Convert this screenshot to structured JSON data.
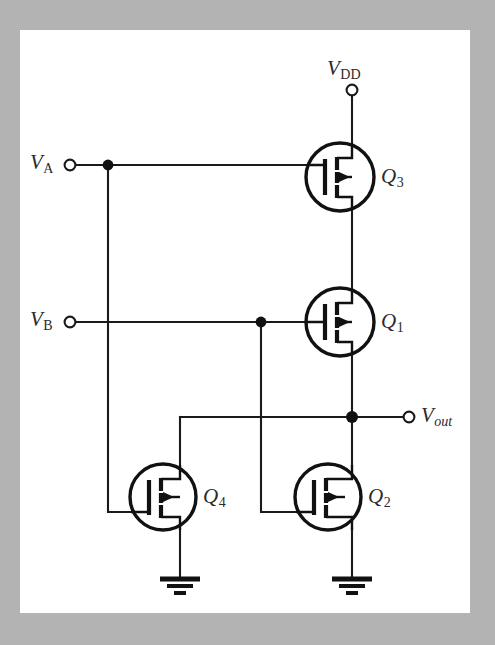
{
  "figure": {
    "kind": "circuit-schematic",
    "background_color": "#b3b3b3",
    "panel_color": "#ffffff",
    "ink_color": "#111111"
  },
  "terminals": [
    {
      "id": "vdd",
      "name": "supply-terminal",
      "symbol": "V",
      "subscript": "DD",
      "subscript_italic": false,
      "label_x": 327,
      "label_y": 58,
      "node_x": 352,
      "node_y": 93
    },
    {
      "id": "va",
      "name": "input-a-terminal",
      "symbol": "V",
      "subscript": "A",
      "subscript_italic": false,
      "label_x": 33,
      "label_y": 152,
      "node_x": 70,
      "node_y": 165
    },
    {
      "id": "vb",
      "name": "input-b-terminal",
      "symbol": "V",
      "subscript": "B",
      "subscript_italic": false,
      "label_x": 33,
      "label_y": 309,
      "node_x": 70,
      "node_y": 322
    },
    {
      "id": "vout",
      "name": "output-terminal",
      "symbol": "V",
      "subscript": "out",
      "subscript_italic": true,
      "label_x": 421,
      "label_y": 405,
      "node_x": 409,
      "node_y": 417
    }
  ],
  "transistors": [
    {
      "id": "q3",
      "name": "transistor-q3",
      "label": "Q",
      "subscript": "3",
      "cx": 340,
      "cy": 177,
      "r": 34,
      "label_x": 381,
      "label_y": 166
    },
    {
      "id": "q1",
      "name": "transistor-q1",
      "label": "Q",
      "subscript": "1",
      "cx": 340,
      "cy": 322,
      "r": 34,
      "label_x": 381,
      "label_y": 311
    },
    {
      "id": "q4",
      "name": "transistor-q4",
      "label": "Q",
      "subscript": "4",
      "cx": 163,
      "cy": 497,
      "r": 33,
      "label_x": 203,
      "label_y": 486
    },
    {
      "id": "q2",
      "name": "transistor-q2",
      "label": "Q",
      "subscript": "2",
      "cx": 328,
      "cy": 497,
      "r": 33,
      "label_x": 368,
      "label_y": 486
    }
  ],
  "junctions": [
    {
      "name": "junction-va-branch",
      "x": 108,
      "y": 165
    },
    {
      "name": "junction-vb-branch",
      "x": 261,
      "y": 322
    },
    {
      "name": "junction-vout-node",
      "x": 352,
      "y": 417
    }
  ],
  "grounds": [
    {
      "name": "ground-symbol-q4",
      "x": 180,
      "y": 578
    },
    {
      "name": "ground-symbol-q2",
      "x": 352,
      "y": 578
    }
  ],
  "nets": [
    {
      "name": "net-vdd-to-q3-drain",
      "path": "M 352 95 L 352 143"
    },
    {
      "name": "net-q3-source-to-q1-drain",
      "path": "M 352 211 L 352 288"
    },
    {
      "name": "net-q1-source-to-vout",
      "path": "M 352 356 L 352 417"
    },
    {
      "name": "net-vout-to-q2-drain",
      "path": "M 352 417 L 352 464"
    },
    {
      "name": "net-q2-source-to-gnd",
      "path": "M 352 530 L 352 579"
    },
    {
      "name": "net-va-lead",
      "path": "M 76 165 L 306 165"
    },
    {
      "name": "net-va-down-to-q4-gate",
      "path": "M 108 165 L 108 512 L 130 512"
    },
    {
      "name": "net-vb-lead",
      "path": "M 76 322 L 306 322"
    },
    {
      "name": "net-vb-down-to-q2-gate",
      "path": "M 261 322 L 261 512 L 295 512"
    },
    {
      "name": "net-vout-left-to-q4-drain",
      "path": "M 180 417 L 403 417"
    },
    {
      "name": "net-q4-drain-riser",
      "path": "M 180 417 L 180 464"
    },
    {
      "name": "net-q4-source-to-gnd",
      "path": "M 180 530 L 180 579"
    }
  ]
}
